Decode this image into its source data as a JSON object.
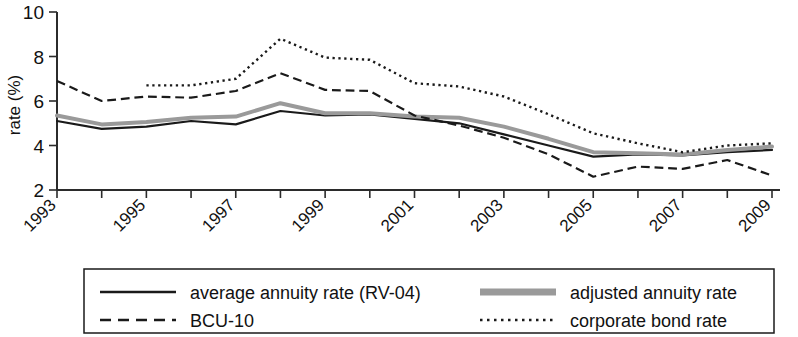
{
  "chart_data": {
    "type": "line",
    "title": "",
    "xlabel": "",
    "ylabel": "rate (%)",
    "xlim": [
      1993,
      2009
    ],
    "ylim": [
      2,
      10
    ],
    "grid": false,
    "legend_position": "bottom",
    "y_ticks": [
      2,
      4,
      6,
      8,
      10
    ],
    "x_ticks": [
      1993,
      1994,
      1995,
      1996,
      1997,
      1998,
      1999,
      2000,
      2001,
      2002,
      2003,
      2004,
      2005,
      2006,
      2007,
      2008,
      2009
    ],
    "x_tick_labels": [
      "1993",
      "",
      "1995",
      "",
      "1997",
      "",
      "1999",
      "",
      "2001",
      "",
      "2003",
      "",
      "2005",
      "",
      "2007",
      "",
      "2009"
    ],
    "series": [
      {
        "name": "average annuity rate (RV-04)",
        "style": "solid",
        "color": "#1a1a1a",
        "width": 2.2,
        "x": [
          1993,
          1994,
          1995,
          1996,
          1997,
          1998,
          1999,
          2000,
          2001,
          2002,
          2003,
          2004,
          2005,
          2006,
          2007,
          2008,
          2009
        ],
        "values": [
          5.1,
          4.75,
          4.85,
          5.1,
          4.95,
          5.55,
          5.35,
          5.4,
          5.2,
          5.0,
          4.5,
          4.0,
          3.5,
          3.6,
          3.55,
          3.7,
          3.8
        ]
      },
      {
        "name": "adjusted annuity rate",
        "style": "solid",
        "color": "#9a9a9a",
        "width": 4.0,
        "x": [
          1993,
          1994,
          1995,
          1996,
          1997,
          1998,
          1999,
          2000,
          2001,
          2002,
          2003,
          2004,
          2005,
          2006,
          2007,
          2008,
          2009
        ],
        "values": [
          5.35,
          4.95,
          5.05,
          5.25,
          5.3,
          5.9,
          5.45,
          5.45,
          5.3,
          5.25,
          4.85,
          4.3,
          3.7,
          3.65,
          3.6,
          3.8,
          3.95
        ]
      },
      {
        "name": "BCU-10",
        "style": "dashed",
        "color": "#1a1a1a",
        "width": 2.2,
        "x": [
          1993,
          1994,
          1995,
          1996,
          1997,
          1998,
          1999,
          2000,
          2001,
          2002,
          2003,
          2004,
          2005,
          2006,
          2007,
          2008,
          2009
        ],
        "values": [
          6.9,
          6.0,
          6.2,
          6.15,
          6.45,
          7.25,
          6.5,
          6.45,
          5.35,
          4.9,
          4.35,
          3.6,
          2.6,
          3.05,
          2.95,
          3.35,
          2.65
        ]
      },
      {
        "name": "corporate bond rate",
        "style": "dotted",
        "color": "#1a1a1a",
        "width": 2.4,
        "x": [
          1995,
          1996,
          1997,
          1998,
          1999,
          2000,
          2001,
          2002,
          2003,
          2004,
          2005,
          2006,
          2007,
          2008,
          2009
        ],
        "values": [
          6.7,
          6.7,
          7.0,
          8.8,
          7.95,
          7.85,
          6.8,
          6.65,
          6.2,
          5.4,
          4.55,
          4.1,
          3.7,
          4.0,
          4.1
        ]
      }
    ]
  },
  "axes": {
    "y_label": "rate (%)",
    "y_tick_labels": [
      "2",
      "4",
      "6",
      "8",
      "10"
    ],
    "x_tick_labels_visible": [
      "1993",
      "1995",
      "1997",
      "1999",
      "2001",
      "2003",
      "2005",
      "2007",
      "2009"
    ]
  },
  "legend": {
    "entries": [
      {
        "label": "average annuity rate (RV-04)",
        "style": "solid",
        "color": "#1a1a1a"
      },
      {
        "label": "adjusted annuity rate",
        "style": "solid-thick",
        "color": "#9a9a9a"
      },
      {
        "label": "BCU-10",
        "style": "dashed",
        "color": "#1a1a1a"
      },
      {
        "label": "corporate bond rate",
        "style": "dotted",
        "color": "#1a1a1a"
      }
    ]
  }
}
